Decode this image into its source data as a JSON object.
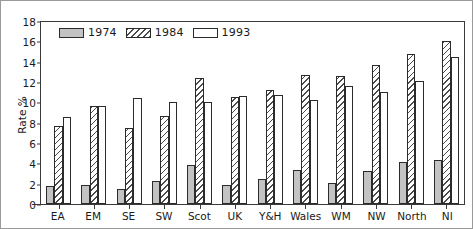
{
  "chart_data": {
    "type": "bar",
    "title": "",
    "xlabel": "",
    "ylabel": "Rate %",
    "ylim": [
      0,
      18
    ],
    "yticks": [
      0,
      2,
      4,
      6,
      8,
      10,
      12,
      14,
      16,
      18
    ],
    "grid": false,
    "legend_position": "top-left-inside",
    "categories": [
      "EA",
      "EM",
      "SE",
      "SW",
      "Scot",
      "UK",
      "Y&H",
      "Wales",
      "WM",
      "NW",
      "North",
      "NI"
    ],
    "series": [
      {
        "name": "1974",
        "style": "solid-gray",
        "color": "#c3c3c3",
        "values": [
          1.8,
          1.9,
          1.5,
          2.3,
          3.8,
          1.9,
          2.5,
          3.3,
          2.1,
          3.2,
          4.1,
          4.3
        ]
      },
      {
        "name": "1984",
        "style": "diagonal-hatch",
        "color": "#ffffff",
        "values": [
          7.7,
          9.6,
          7.5,
          8.7,
          12.4,
          10.5,
          11.2,
          12.7,
          12.6,
          13.7,
          14.8,
          16.0
        ]
      },
      {
        "name": "1993",
        "style": "white",
        "color": "#ffffff",
        "values": [
          8.6,
          9.65,
          10.4,
          10.0,
          10.0,
          10.6,
          10.7,
          10.2,
          11.6,
          11.0,
          12.1,
          14.5
        ]
      }
    ]
  },
  "legend": {
    "items": [
      {
        "label": "1974",
        "swatch": "legend-swatch-solid-gray"
      },
      {
        "label": "1984",
        "swatch": "legend-swatch-hatched"
      },
      {
        "label": "1993",
        "swatch": "legend-swatch-white"
      }
    ]
  }
}
